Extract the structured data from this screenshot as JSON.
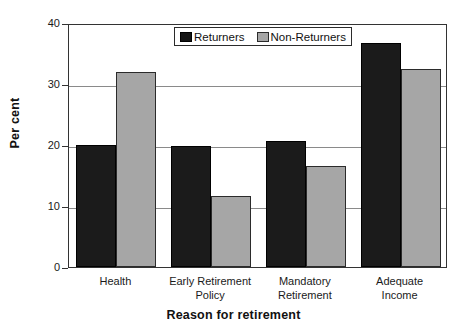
{
  "chart_data": {
    "type": "bar",
    "title": "",
    "xlabel": "Reason for retirement",
    "ylabel": "Per cent",
    "categories": [
      "Health",
      "Early Retirement Policy",
      "Mandatory Retirement",
      "Adequate Income"
    ],
    "category_lines": [
      [
        "Health"
      ],
      [
        "Early Retirement",
        "Policy"
      ],
      [
        "Mandatory",
        "Retirement"
      ],
      [
        "Adequate",
        "Income"
      ]
    ],
    "series": [
      {
        "name": "Returners",
        "color": "#1b1b1b",
        "values": [
          20.0,
          19.8,
          20.7,
          36.8
        ]
      },
      {
        "name": "Non-Returners",
        "color": "#a6a6a6",
        "values": [
          32.0,
          11.7,
          16.6,
          32.5
        ]
      }
    ],
    "ylim": [
      0,
      40
    ],
    "yticks": [
      0,
      10,
      20,
      30,
      40
    ],
    "ytick_labels": [
      "0",
      "10",
      "20",
      "30",
      "40"
    ],
    "grid": "horizontal",
    "legend_position": "top-center"
  },
  "legend": {
    "entries": [
      {
        "label": "Returners",
        "swatch": "black"
      },
      {
        "label": "Non-Returners",
        "swatch": "gray"
      }
    ]
  }
}
